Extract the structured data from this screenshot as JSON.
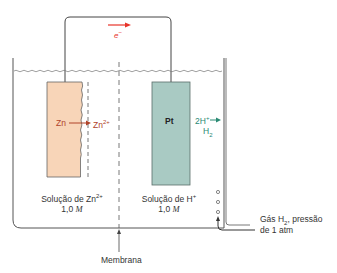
{
  "colors": {
    "wire": "#444444",
    "electron": "#e8342a",
    "zinc_fill": "#f8d5b8",
    "zinc_text": "#b0442a",
    "platinum_fill": "#a9cac3",
    "platinum_stroke": "#5b6e6a",
    "hydrogen_text": "#2a8a73",
    "liquid": "#777777"
  },
  "electron_label": "e",
  "electron_sup": "−",
  "zinc": {
    "label": "Zn",
    "ion_label": "Zn",
    "ion_sup": "2+"
  },
  "platinum": {
    "label": "Pt",
    "reaction_lhs": "2H",
    "reaction_lhs_sup": "+",
    "reaction_rhs": "H",
    "reaction_rhs_sub": "2"
  },
  "left_solution": {
    "line1": "Solução de Zn",
    "line1_sup": "2+",
    "conc": "1,0",
    "unit": "M"
  },
  "right_solution": {
    "line1": "Solução de H",
    "line1_sup": "+",
    "conc": "1,0",
    "unit": "M"
  },
  "membrane_label": "Membrana",
  "gas_label": {
    "line1_pre": "Gás H",
    "line1_sub": "2",
    "line1_post": ", pressão",
    "line2": "de 1 atm"
  }
}
